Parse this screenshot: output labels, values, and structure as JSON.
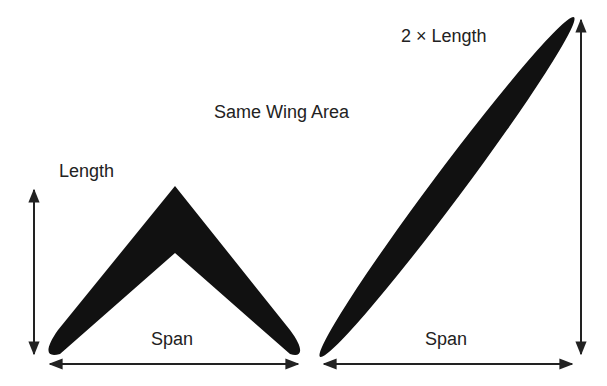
{
  "title": "Same Wing Area",
  "left_wing": {
    "length_label": "Length",
    "span_label": "Span"
  },
  "right_wing": {
    "length_label": "2 × Length",
    "span_label": "Span"
  },
  "colors": {
    "wing_fill": "#111111",
    "arrow": "#222222",
    "text": "#222222"
  }
}
